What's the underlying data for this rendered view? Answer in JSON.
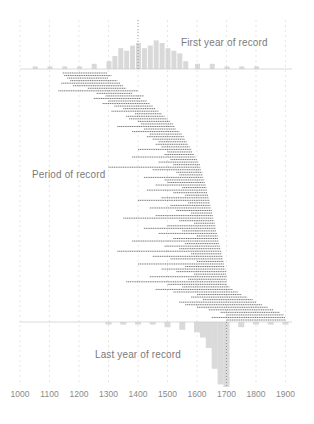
{
  "chart_data": {
    "type": "bar",
    "subtype": "period-of-record timeline with marginal histograms",
    "title": "",
    "xlabel": "",
    "ylabel": "",
    "xlim": [
      1000,
      1900
    ],
    "x_ticks": [
      1000,
      1100,
      1200,
      1300,
      1400,
      1500,
      1600,
      1700,
      1800,
      1900
    ],
    "grid": "vertical dashed lines at each century",
    "annotations": {
      "first": "First year of record",
      "period": "Period of record",
      "last": "Last year of record"
    },
    "first_year_histogram": {
      "description": "Histogram above baseline of first years of record; peaks around 1350-1550",
      "bins": [
        1050,
        1100,
        1150,
        1200,
        1250,
        1300,
        1320,
        1340,
        1360,
        1380,
        1400,
        1420,
        1440,
        1460,
        1480,
        1500,
        1520,
        1540,
        1560,
        1600,
        1650,
        1700,
        1750,
        1800
      ],
      "counts": [
        1,
        1,
        1,
        1,
        2,
        3,
        5,
        8,
        7,
        9,
        10,
        8,
        9,
        11,
        10,
        8,
        7,
        6,
        3,
        2,
        2,
        1,
        1,
        1
      ]
    },
    "last_year_histogram": {
      "description": "Histogram below baseline of last years of record; concentrated 1640-1700 with peak near 1680-1700",
      "bins": [
        1300,
        1350,
        1400,
        1450,
        1500,
        1550,
        1600,
        1620,
        1640,
        1660,
        1680,
        1700,
        1750,
        1800,
        1850,
        1900
      ],
      "counts": [
        1,
        1,
        1,
        1,
        2,
        3,
        4,
        6,
        10,
        18,
        24,
        25,
        2,
        1,
        1,
        1
      ]
    },
    "periods": [
      [
        1145,
        1295
      ],
      [
        1150,
        1310
      ],
      [
        1160,
        1300
      ],
      [
        1170,
        1330
      ],
      [
        1140,
        1340
      ],
      [
        1180,
        1350
      ],
      [
        1230,
        1360
      ],
      [
        1130,
        1400
      ],
      [
        1260,
        1380
      ],
      [
        1290,
        1420
      ],
      [
        1250,
        1410
      ],
      [
        1300,
        1430
      ],
      [
        1280,
        1440
      ],
      [
        1320,
        1450
      ],
      [
        1350,
        1460
      ],
      [
        1310,
        1470
      ],
      [
        1390,
        1480
      ],
      [
        1360,
        1490
      ],
      [
        1370,
        1500
      ],
      [
        1400,
        1510
      ],
      [
        1410,
        1520
      ],
      [
        1330,
        1525
      ],
      [
        1420,
        1530
      ],
      [
        1380,
        1540
      ],
      [
        1440,
        1550
      ],
      [
        1430,
        1555
      ],
      [
        1450,
        1560
      ],
      [
        1470,
        1565
      ],
      [
        1460,
        1570
      ],
      [
        1480,
        1575
      ],
      [
        1400,
        1580
      ],
      [
        1500,
        1585
      ],
      [
        1490,
        1590
      ],
      [
        1380,
        1595
      ],
      [
        1510,
        1600
      ],
      [
        1470,
        1605
      ],
      [
        1520,
        1610
      ],
      [
        1300,
        1612
      ],
      [
        1450,
        1615
      ],
      [
        1530,
        1618
      ],
      [
        1540,
        1620
      ],
      [
        1420,
        1622
      ],
      [
        1490,
        1625
      ],
      [
        1500,
        1628
      ],
      [
        1460,
        1630
      ],
      [
        1550,
        1632
      ],
      [
        1430,
        1634
      ],
      [
        1520,
        1636
      ],
      [
        1560,
        1638
      ],
      [
        1480,
        1640
      ],
      [
        1400,
        1642
      ],
      [
        1570,
        1644
      ],
      [
        1510,
        1646
      ],
      [
        1440,
        1648
      ],
      [
        1530,
        1650
      ],
      [
        1580,
        1652
      ],
      [
        1460,
        1654
      ],
      [
        1350,
        1656
      ],
      [
        1540,
        1658
      ],
      [
        1590,
        1660
      ],
      [
        1500,
        1662
      ],
      [
        1420,
        1664
      ],
      [
        1550,
        1666
      ],
      [
        1470,
        1668
      ],
      [
        1600,
        1670
      ],
      [
        1520,
        1672
      ],
      [
        1380,
        1674
      ],
      [
        1560,
        1676
      ],
      [
        1490,
        1678
      ],
      [
        1540,
        1680
      ],
      [
        1330,
        1682
      ],
      [
        1580,
        1684
      ],
      [
        1450,
        1686
      ],
      [
        1510,
        1688
      ],
      [
        1600,
        1690
      ],
      [
        1400,
        1692
      ],
      [
        1560,
        1694
      ],
      [
        1480,
        1696
      ],
      [
        1530,
        1698
      ],
      [
        1590,
        1699
      ],
      [
        1440,
        1700
      ],
      [
        1570,
        1700
      ],
      [
        1360,
        1700
      ],
      [
        1500,
        1702
      ],
      [
        1550,
        1710
      ],
      [
        1460,
        1720
      ],
      [
        1520,
        1740
      ],
      [
        1600,
        1750
      ],
      [
        1580,
        1770
      ],
      [
        1620,
        1790
      ],
      [
        1540,
        1800
      ],
      [
        1560,
        1820
      ],
      [
        1600,
        1840
      ],
      [
        1640,
        1860
      ],
      [
        1680,
        1880
      ],
      [
        1700,
        1895
      ],
      [
        1650,
        1900
      ],
      [
        1700,
        1900
      ]
    ]
  }
}
